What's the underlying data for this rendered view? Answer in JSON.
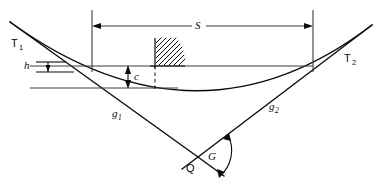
{
  "figure": {
    "canvas": {
      "width": 383,
      "height": 190,
      "background": "#ffffff"
    },
    "line_color": "#0b0b0b",
    "labels": {
      "tangent_point_left": "T",
      "tangent_point_left_sub": "1",
      "tangent_point_right": "T",
      "tangent_point_right_sub": "2",
      "grade_left": "g",
      "grade_left_sub": "1",
      "grade_right": "g",
      "grade_right_sub": "2",
      "sight_distance": "S",
      "offset_c": "c",
      "height_h": "h",
      "vertex": "Q",
      "angle": "G"
    },
    "elements": {
      "sight_distance_dimension": "S",
      "middle_ordinate_dimension": "c",
      "eye_height_dimension": "h",
      "deflection_angle": "G",
      "vertex_point": "Q",
      "hatched_obstruction": "hatched-object",
      "curve": "parabolic-vertical-curve",
      "tangent_left": "g1",
      "tangent_right": "g2"
    }
  }
}
